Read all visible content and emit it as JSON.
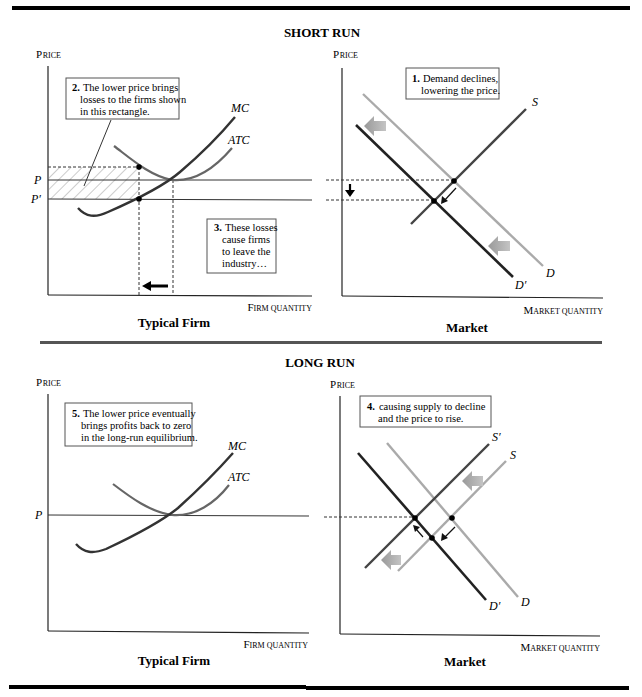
{
  "sections": {
    "short_run": {
      "title": "SHORT RUN",
      "firm": {
        "panel_title": "Typical Firm",
        "y_axis_label_cap": "P",
        "y_axis_label_rest": "RICE",
        "x_axis_label_cap": "F",
        "x_axis_label_rest": "IRM QUANTITY",
        "price_labels": [
          "P",
          "P′"
        ],
        "curve_labels": {
          "mc": "MC",
          "atc": "ATC"
        },
        "note_2": {
          "num": "2.",
          "lines": [
            "The lower price brings",
            "losses to the firms shown",
            "in this rectangle."
          ]
        },
        "note_3": {
          "num": "3.",
          "lines": [
            "These losses",
            "cause firms",
            "to leave the",
            "industry…"
          ]
        }
      },
      "market": {
        "panel_title": "Market",
        "y_axis_label_cap": "P",
        "y_axis_label_rest": "RICE",
        "x_axis_label_cap": "M",
        "x_axis_label_rest": "ARKET QUANTITY",
        "curve_labels": {
          "s": "S",
          "d": "D",
          "d_prime": "D′"
        },
        "note_1": {
          "num": "1.",
          "lines": [
            "Demand declines,",
            "lowering the price."
          ]
        }
      }
    },
    "long_run": {
      "title": "LONG RUN",
      "firm": {
        "panel_title": "Typical Firm",
        "y_axis_label_cap": "P",
        "y_axis_label_rest": "RICE",
        "x_axis_label_cap": "F",
        "x_axis_label_rest": "IRM QUANTITY",
        "price_labels": [
          "P"
        ],
        "curve_labels": {
          "mc": "MC",
          "atc": "ATC"
        },
        "note_5": {
          "num": "5.",
          "lines": [
            "The lower price eventually",
            "brings profits back to zero",
            "in the long-run equilibrium."
          ]
        }
      },
      "market": {
        "panel_title": "Market",
        "y_axis_label_cap": "P",
        "y_axis_label_rest": "RICE",
        "x_axis_label_cap": "M",
        "x_axis_label_rest": "ARKET QUANTITY",
        "curve_labels": {
          "s_prime": "S′",
          "s": "S",
          "d": "D",
          "d_prime": "D′"
        },
        "note_4": {
          "num": "4.",
          "lines": [
            "causing supply to decline",
            "and the price to rise."
          ]
        }
      }
    }
  },
  "colors": {
    "dark_curve": "#222222",
    "mid_curve": "#555555",
    "light_curve": "#aaaaaa",
    "shift_arrow": "#8c8c8c",
    "hatch": "#999999",
    "rule": "#000000",
    "separator": "#555555"
  }
}
